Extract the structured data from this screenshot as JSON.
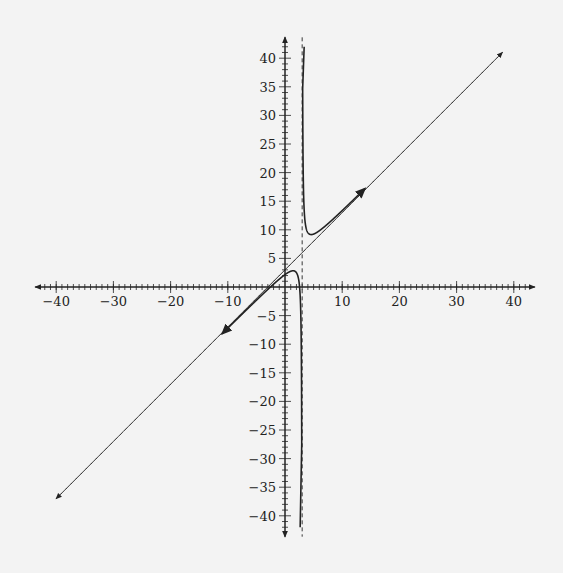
{
  "chart_data": {
    "type": "line",
    "title": "",
    "xlabel": "",
    "ylabel": "",
    "xlim": [
      -44,
      44
    ],
    "ylim": [
      -44,
      44
    ],
    "grid": false,
    "x_ticks_major": [
      -40,
      -30,
      -20,
      -10,
      10,
      20,
      30,
      40
    ],
    "x_tick_labels": [
      "−40",
      "−30",
      "−20",
      "−10",
      "10",
      "20",
      "30",
      "40"
    ],
    "y_ticks_major": [
      -40,
      -35,
      -30,
      -25,
      -20,
      -15,
      -10,
      -5,
      5,
      10,
      15,
      20,
      25,
      30,
      35,
      40
    ],
    "y_tick_labels": [
      "−40",
      "−35",
      "−30",
      "−25",
      "−20",
      "−15",
      "−10",
      "−5",
      "5",
      "10",
      "15",
      "20",
      "25",
      "30",
      "35",
      "40"
    ],
    "minor_tick_step": 1,
    "series": [
      {
        "name": "rational function y = x + 3 + 2.5/(x − 3)",
        "style": "solid",
        "branches": [
          {
            "x_range": [
              -11,
              2.97
            ],
            "arrow_start": true,
            "arrow_end": false
          },
          {
            "x_range": [
              3.03,
              14
            ],
            "arrow_start": false,
            "arrow_end": true
          }
        ]
      },
      {
        "name": "slant asymptote y = x + 3",
        "style": "dashed",
        "x_range": [
          -40,
          38
        ]
      },
      {
        "name": "vertical asymptote x = 3",
        "style": "dashed",
        "x": 3
      }
    ],
    "key_points": [
      {
        "label": "local max (lower branch)",
        "x": 1.4,
        "y": 2.8
      },
      {
        "label": "local min (upper branch)",
        "x": 4.6,
        "y": 9.2
      }
    ]
  },
  "colors": {
    "background": "#f3f3f3",
    "ink": "#222222"
  }
}
